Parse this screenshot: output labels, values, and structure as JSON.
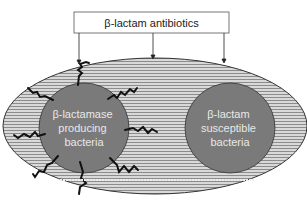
{
  "top_box": {
    "label": "β-lactam antibiotics"
  },
  "left_cell": {
    "lines": [
      "β-lactamase",
      "producing",
      "bacteria"
    ]
  },
  "right_cell": {
    "lines": [
      "β-lactam",
      "susceptible",
      "bacteria"
    ]
  },
  "colors": {
    "ellipse_fill": "#bdbdbd",
    "cell_fill": "#7a7a7a",
    "cell_text": "#e8e8e8",
    "line": "#111111"
  }
}
